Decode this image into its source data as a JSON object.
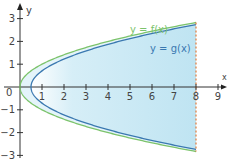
{
  "chart_data": {
    "type": "area",
    "title": "",
    "xlabel": "x",
    "ylabel": "y",
    "xlim": [
      0,
      9.5
    ],
    "ylim": [
      -3,
      3
    ],
    "x_ticks": [
      "1",
      "2",
      "3",
      "4",
      "5",
      "6",
      "7",
      "8",
      "9"
    ],
    "y_ticks": [
      "3",
      "2",
      "1",
      "-1",
      "-2",
      "-3"
    ],
    "origin_label": "0",
    "grid": false,
    "series": [
      {
        "name": "y = f(x)",
        "color": "#7cc36b",
        "function": "±sqrt(x)",
        "x_start": 0,
        "x_end": 8
      },
      {
        "name": "y = g(x)",
        "color": "#3a78b0",
        "function": "±sqrt(x-0.5)",
        "x_start": 0.5,
        "x_end": 8
      }
    ],
    "boundary": {
      "x": 8,
      "style": "dashed",
      "color": "#e07a3a"
    },
    "shaded_region": {
      "between": [
        "g(x)",
        "x=8"
      ],
      "color": "#bfe4f2"
    },
    "annotations": [
      {
        "text": "y = f(x)",
        "color": "#7cc36b"
      },
      {
        "text": "y = g(x)",
        "color": "#3a78b0"
      }
    ]
  },
  "labels": {
    "f": "y = f(x)",
    "g": "y = g(x)",
    "x_axis": "x",
    "y_axis": "y",
    "origin": "0"
  }
}
